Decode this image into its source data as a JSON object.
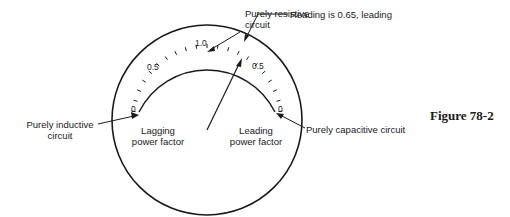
{
  "figure": {
    "caption": "Figure 78-2"
  },
  "dial": {
    "scale_labels": {
      "left_zero": "0",
      "left_half": "0.5",
      "top_unity": "1.0",
      "right_half": "0.5",
      "right_zero": "0"
    },
    "region_labels": {
      "lagging_line1": "Lagging",
      "lagging_line2": "power factor",
      "leading_line1": "Leading",
      "leading_line2": "power factor"
    },
    "reading_value": 0.65,
    "reading_side": "leading"
  },
  "callouts": {
    "purely_resistive_line1": "Purely resistive",
    "purely_resistive_line2": "circuit",
    "reading": "Reading is 0.65, leading",
    "purely_inductive_line1": "Purely inductive",
    "purely_inductive_line2": "circuit",
    "purely_capacitive": "Purely capacitive circuit"
  },
  "colors": {
    "ink": "#1a1a1a",
    "background": "#ffffff"
  }
}
